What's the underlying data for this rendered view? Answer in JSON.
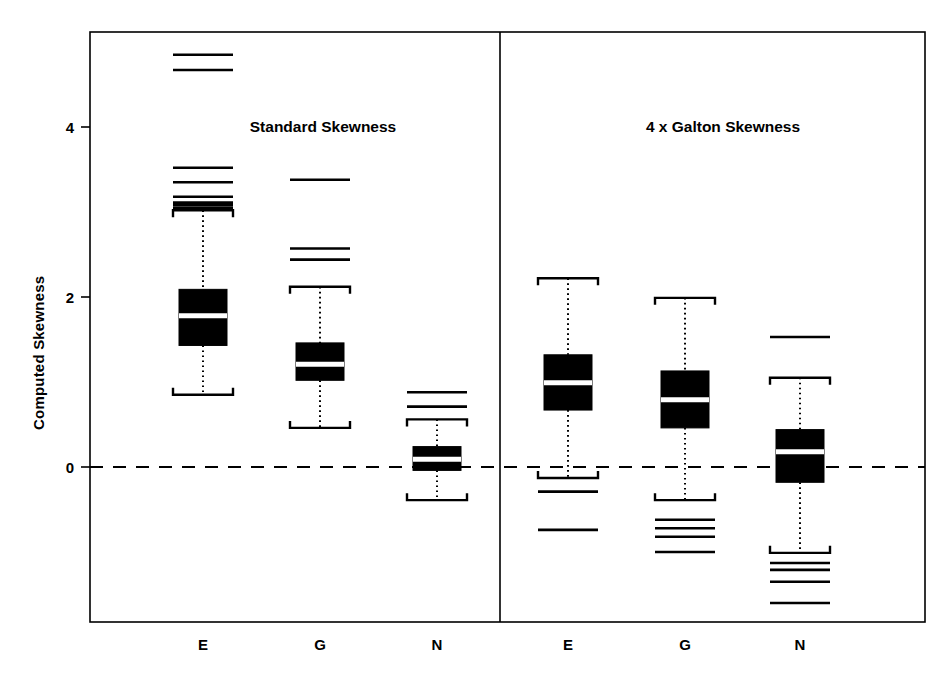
{
  "figure": {
    "ylabel": "Computed Skewness",
    "background": "#ffffff",
    "ink": "#000000"
  },
  "panels": [
    {
      "id": "standard",
      "title": "Standard Skewness"
    },
    {
      "id": "galton",
      "title": "4 x Galton Skewness"
    }
  ],
  "axis": {
    "y_ticks": [
      "0",
      "2",
      "4"
    ],
    "y_tick_values": [
      0,
      2,
      4
    ],
    "x_labels_left": [
      "E",
      "G",
      "N"
    ],
    "x_labels_right": [
      "E",
      "G",
      "N"
    ]
  },
  "chart_data": {
    "type": "box",
    "title": "",
    "subtitle": "",
    "xlabel": "",
    "ylabel": "Computed Skewness",
    "ylim": [
      -1.85,
      5.35
    ],
    "yticks": [
      0,
      2,
      4
    ],
    "grid": false,
    "legend": "none",
    "reference_lines": [
      {
        "value": 0,
        "style": "dashed",
        "orientation": "horizontal"
      }
    ],
    "panels": [
      {
        "name": "Standard Skewness",
        "groups": [
          {
            "label": "E",
            "whisker_low": 0.85,
            "q1": 1.43,
            "median": 1.78,
            "q3": 2.09,
            "whisker_high": 3.02,
            "outliers_high": [
              3.05,
              3.08,
              3.11,
              3.18,
              3.35,
              3.52,
              4.67,
              4.85
            ],
            "outliers_low": []
          },
          {
            "label": "G",
            "whisker_low": 0.46,
            "q1": 1.02,
            "median": 1.21,
            "q3": 1.46,
            "whisker_high": 2.12,
            "outliers_high": [
              2.44,
              2.57,
              3.38
            ],
            "outliers_low": []
          },
          {
            "label": "N",
            "whisker_low": -0.39,
            "q1": -0.04,
            "median": 0.09,
            "q3": 0.24,
            "whisker_high": 0.56,
            "outliers_high": [
              0.71,
              0.88
            ],
            "outliers_low": []
          }
        ]
      },
      {
        "name": "4 x Galton Skewness",
        "groups": [
          {
            "label": "E",
            "whisker_low": -0.13,
            "q1": 0.67,
            "median": 0.99,
            "q3": 1.32,
            "whisker_high": 2.22,
            "outliers_high": [],
            "outliers_low": [
              -0.29,
              -0.74
            ]
          },
          {
            "label": "G",
            "whisker_low": -0.39,
            "q1": 0.46,
            "median": 0.79,
            "q3": 1.13,
            "whisker_high": 1.99,
            "outliers_high": [],
            "outliers_low": [
              -0.62,
              -0.72,
              -0.82,
              -1.0
            ]
          },
          {
            "label": "N",
            "whisker_low": -1.01,
            "q1": -0.18,
            "median": 0.18,
            "q3": 0.44,
            "whisker_high": 1.05,
            "outliers_high": [
              1.53
            ],
            "outliers_low": [
              -1.13,
              -1.21,
              -1.35,
              -1.6
            ]
          }
        ]
      }
    ]
  }
}
